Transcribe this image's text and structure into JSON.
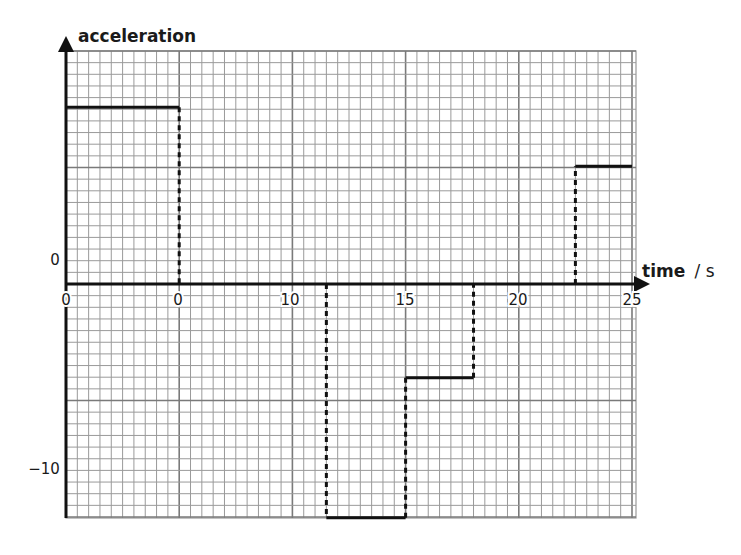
{
  "chart_data": {
    "type": "line",
    "subtype": "step",
    "title": "",
    "xlabel": "time",
    "xlabel_unit": "/ s",
    "ylabel": "acceleration",
    "x_tick_labels": [
      "0",
      "0",
      "10",
      "15",
      "20",
      "25"
    ],
    "x_tick_values": [
      0,
      5,
      10,
      15,
      20,
      25
    ],
    "y_tick_labels": [
      "0",
      "−10"
    ],
    "y_tick_values": [
      0,
      -10
    ],
    "xlim": [
      0,
      25
    ],
    "ylim": [
      -12.7,
      12.7
    ],
    "grid": true,
    "legend": null,
    "segments": [
      {
        "x_start": 0,
        "x_end": 5,
        "y": 9.6
      },
      {
        "x_start": 5,
        "x_end": 11.5,
        "y": 0
      },
      {
        "x_start": 11.5,
        "x_end": 15,
        "y": -12.7
      },
      {
        "x_start": 15,
        "x_end": 18,
        "y": -5.1
      },
      {
        "x_start": 18,
        "x_end": 22.5,
        "y": 0
      },
      {
        "x_start": 22.5,
        "x_end": 25,
        "y": 6.4
      }
    ],
    "dashed_transitions_at_x": [
      5,
      11.5,
      15,
      18,
      22.5
    ],
    "colors": {
      "line": "#111111",
      "grid_minor": "#9a9a9a",
      "grid_major": "#7a7a7a",
      "axis": "#111111"
    }
  }
}
